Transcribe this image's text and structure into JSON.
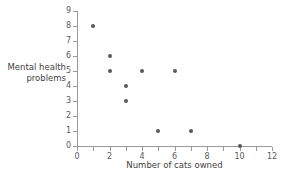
{
  "chart_data": {
    "type": "scatter",
    "title": "",
    "xlabel": "Number of cats owned",
    "ylabel_lines": [
      "Mental health",
      "problems"
    ],
    "ylabel": "Mental health problems",
    "xlim": [
      0,
      12
    ],
    "ylim": [
      0,
      9
    ],
    "grid": false,
    "legend": null,
    "x_ticks": [
      0,
      1,
      2,
      3,
      4,
      5,
      6,
      7,
      8,
      9,
      10,
      11,
      12
    ],
    "x_tick_labels": [
      "0",
      "",
      "2",
      "",
      "4",
      "",
      "6",
      "",
      "8",
      "",
      "10",
      "",
      "12"
    ],
    "y_ticks": [
      0,
      1,
      2,
      3,
      4,
      5,
      6,
      7,
      8,
      9
    ],
    "y_tick_labels": [
      "0",
      "1",
      "2",
      "3",
      "4",
      "5",
      "6",
      "7",
      "8",
      "9"
    ],
    "points": [
      {
        "x": 1,
        "y": 8
      },
      {
        "x": 2,
        "y": 6
      },
      {
        "x": 2,
        "y": 5
      },
      {
        "x": 3,
        "y": 4
      },
      {
        "x": 3,
        "y": 3
      },
      {
        "x": 4,
        "y": 5
      },
      {
        "x": 5,
        "y": 1
      },
      {
        "x": 6,
        "y": 5
      },
      {
        "x": 7,
        "y": 1
      },
      {
        "x": 10,
        "y": 0
      }
    ],
    "marker_color": "#595959",
    "axis_color": "#9a9a9a",
    "background_color": "#ffffff"
  }
}
